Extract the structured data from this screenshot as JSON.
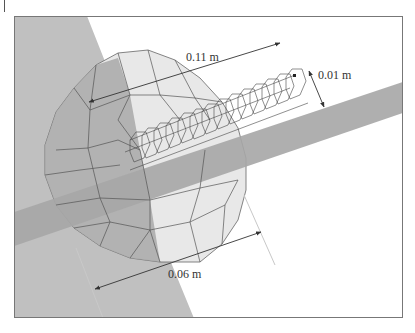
{
  "figure": {
    "type": "3D FEM mesh diagram of a helical coil inside a slab geometry",
    "colors": {
      "background": "#ffffff",
      "frame": "#777777",
      "slab_panel": "#bdbdbd",
      "band": "#a9a9a9",
      "disk_light": "#e6e6e6",
      "disk_dark": "#9e9e9e",
      "mesh_line": "#555555",
      "coil_line": "#444444",
      "arrow": "#333333",
      "extension_line": "#c8c8c8"
    }
  },
  "dimensions": {
    "length": {
      "label": "0.11 m"
    },
    "coil_diameter": {
      "label": "0.01 m"
    },
    "disk_diameter": {
      "label": "0.06 m"
    }
  }
}
